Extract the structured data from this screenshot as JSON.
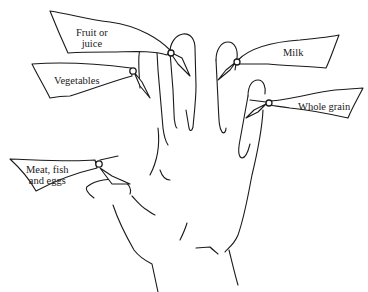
{
  "diagram": {
    "colors": {
      "ink": "#1a1a1a",
      "background": "#ffffff"
    },
    "labels": [
      {
        "id": "fruit",
        "text": "Fruit or\njuice",
        "finger": "index"
      },
      {
        "id": "vegetables",
        "text": "Vegetables",
        "finger": "index-side"
      },
      {
        "id": "milk",
        "text": "Milk",
        "finger": "ring"
      },
      {
        "id": "whole-grain",
        "text": "Whole grain",
        "finger": "little"
      },
      {
        "id": "meat",
        "text": "Meat, fish\nand eggs",
        "finger": "thumb"
      }
    ]
  }
}
